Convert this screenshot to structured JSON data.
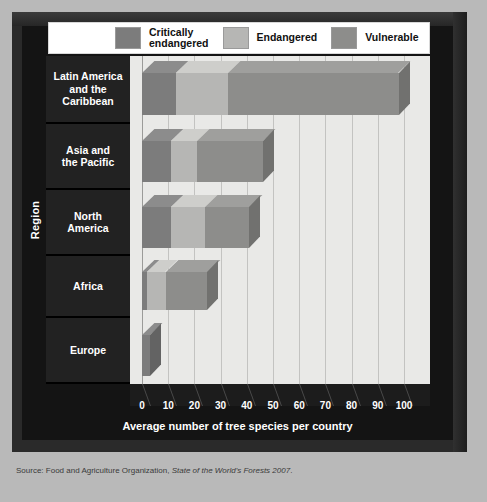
{
  "legend": {
    "items": [
      {
        "label": "Critically\nendangered",
        "key": "critically_endangered",
        "color": "#7c7c7c"
      },
      {
        "label": "Endangered",
        "key": "endangered",
        "color": "#b6b6b4"
      },
      {
        "label": "Vulnerable",
        "key": "vulnerable",
        "color": "#8d8d8b"
      }
    ]
  },
  "axes": {
    "y_title": "Region",
    "x_title": "Average number of tree species per country",
    "x_ticks": [
      "0",
      "10",
      "20",
      "30",
      "40",
      "50",
      "60",
      "70",
      "80",
      "90",
      "100"
    ]
  },
  "source": {
    "prefix": "Source: Food and Agriculture Organization, ",
    "italic": "State of the World's Forests 2007",
    "suffix": "."
  },
  "chart_data": {
    "type": "bar",
    "orientation": "horizontal",
    "stacked": true,
    "title": "",
    "xlabel": "Average number of tree species per country",
    "ylabel": "Region",
    "xlim": [
      0,
      110
    ],
    "xticks": [
      0,
      10,
      20,
      30,
      40,
      50,
      60,
      70,
      80,
      90,
      100
    ],
    "grid": true,
    "legend_position": "top",
    "categories": [
      "Latin America and the Caribbean",
      "Asia and the Pacific",
      "North America",
      "Africa",
      "Europe"
    ],
    "series": [
      {
        "name": "Critically endangered",
        "color": "#7c7c7c",
        "values": [
          13,
          11,
          11,
          2,
          3
        ]
      },
      {
        "name": "Endangered",
        "color": "#b6b6b4",
        "values": [
          20,
          10,
          13,
          7,
          0
        ]
      },
      {
        "name": "Vulnerable",
        "color": "#8d8d8b",
        "values": [
          65,
          25,
          17,
          16,
          0
        ]
      }
    ],
    "totals": [
      98,
      46,
      41,
      25,
      3
    ],
    "units": "average number of tree species per country"
  },
  "regions": [
    {
      "name": "Latin America\nand the\nCaribbean",
      "top": 0,
      "height": 68
    },
    {
      "name": "Asia and\nthe Pacific",
      "top": 68,
      "height": 66
    },
    {
      "name": "North\nAmerica",
      "top": 134,
      "height": 66
    },
    {
      "name": "Africa",
      "top": 200,
      "height": 62
    },
    {
      "name": "Europe",
      "top": 262,
      "height": 66
    }
  ]
}
